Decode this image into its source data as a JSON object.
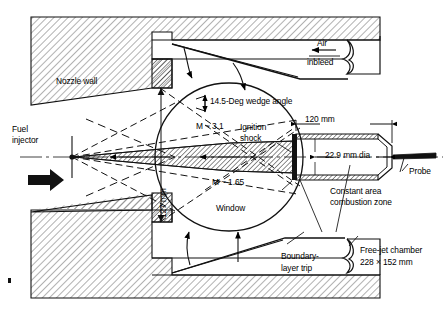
{
  "figure": {
    "type": "engineering-cross-section-diagram",
    "width": 443,
    "height": 312,
    "background_color": "#ffffff",
    "line_color": "#000000",
    "hatch_color": "#8a8a8a"
  },
  "labels": {
    "nozzle_wall": "Nozzle wall",
    "fuel_injector_line1": "Fuel",
    "fuel_injector_line2": "injector",
    "air_inbleed_line1": "Air",
    "air_inbleed_line2": "inbleed",
    "wedge_angle": "14.5-Deg wedge angle",
    "ignition_shock_line1": "Ignition",
    "ignition_shock_line2": "shock",
    "dim_120": "120 mm",
    "dim_229": "22.9 mm dia",
    "dim_127": "127 mm",
    "probe": "Probe",
    "constant_area_line1": "Constant area",
    "constant_area_line2": "combustion zone",
    "mach_upstream": "M ~ 3.1",
    "mach_downstream": "M ~ 1.65",
    "window": "Window",
    "boundary_trip_line1": "Boundary-",
    "boundary_trip_line2": "layer trip",
    "free_jet_line1": "Free-jet chamber",
    "free_jet_line2": "228 × 152 mm"
  },
  "measurements": {
    "wedge_angle_deg": 14.5,
    "combustor_length_mm": 120,
    "combustor_diameter_mm": 22.9,
    "nozzle_exit_height_mm": 127,
    "free_jet_chamber_mm": "228 × 152",
    "mach_number_upstream": 3.1,
    "mach_number_downstream": 1.65
  },
  "components": [
    {
      "name": "nozzle-wall",
      "description": "Hatched solid nozzle wall, upper and lower"
    },
    {
      "name": "fuel-injector",
      "description": "Fuel injector at nozzle throat centerline with flow arrow"
    },
    {
      "name": "air-inbleed",
      "description": "Air inbleed passage at upper right, arrow pointing left"
    },
    {
      "name": "window",
      "description": "Circular optical viewing window around combustion region"
    },
    {
      "name": "combustion-tube",
      "description": "Constant area combustion zone duct, 22.9 mm dia, 120 mm long"
    },
    {
      "name": "probe",
      "description": "Probe inserted downstream of combustor exit"
    },
    {
      "name": "boundary-layer-trip",
      "description": "Inclined boundary-layer trip ramp at lower chamber"
    },
    {
      "name": "free-jet-chamber",
      "description": "Free-jet chamber enclosure 228 × 152 mm"
    },
    {
      "name": "ignition-shock",
      "description": "Ignition shock at combustor inlet"
    }
  ]
}
